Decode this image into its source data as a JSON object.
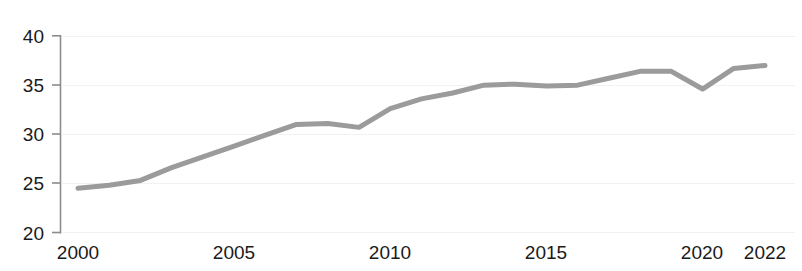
{
  "chart_data": {
    "type": "line",
    "title": "",
    "subtitle": "",
    "xlabel": "",
    "ylabel": "",
    "xlim": [
      2000,
      2022
    ],
    "ylim": [
      20,
      40
    ],
    "grid": true,
    "grid_axis": "y",
    "legend": false,
    "legend_position": "none",
    "line_color": "#9b9b9b",
    "axis_color": "#8c8c8c",
    "text_color": "#1a1a1a",
    "grid_color": "#f1f1f1",
    "x_ticks": [
      2000,
      2005,
      2010,
      2015,
      2020,
      2022
    ],
    "x_tick_labels": [
      "2000",
      "2005",
      "2010",
      "2015",
      "2020",
      "2022"
    ],
    "y_ticks": [
      20,
      25,
      30,
      35,
      40
    ],
    "y_tick_labels": [
      "20",
      "25",
      "30",
      "35",
      "40"
    ],
    "x": [
      2000,
      2001,
      2002,
      2003,
      2004,
      2005,
      2006,
      2007,
      2008,
      2009,
      2010,
      2011,
      2012,
      2013,
      2014,
      2015,
      2016,
      2017,
      2018,
      2019,
      2020,
      2021,
      2022
    ],
    "series": [
      {
        "name": "series-1",
        "color": "#9b9b9b",
        "values": [
          24.5,
          24.8,
          25.3,
          26.6,
          27.7,
          28.8,
          29.9,
          31.0,
          31.1,
          30.7,
          32.6,
          33.6,
          34.2,
          35.0,
          35.1,
          34.9,
          35.0,
          35.7,
          36.4,
          36.4,
          34.6,
          36.7,
          37.0
        ]
      }
    ]
  }
}
